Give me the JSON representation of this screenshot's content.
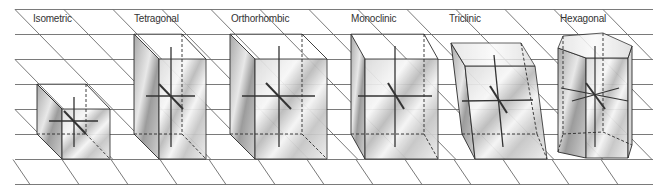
{
  "figure": {
    "type": "crystal-systems-diagram",
    "systems": [
      {
        "label": "Isometric",
        "label_x": 33,
        "label_y": 19
      },
      {
        "label": "Tetragonal",
        "label_x": 134,
        "label_y": 19
      },
      {
        "label": "Orthorhombic",
        "label_x": 231,
        "label_y": 19
      },
      {
        "label": "Monoclinic",
        "label_x": 351,
        "label_y": 19
      },
      {
        "label": "Triclinic",
        "label_x": 449,
        "label_y": 19
      },
      {
        "label": "Hexagonal",
        "label_x": 560,
        "label_y": 19
      }
    ],
    "colors": {
      "grid_line": "#6e6e6e",
      "edge": "#2a2a2a",
      "axis": "#333333",
      "face_light": "#f2f2f2",
      "face_mid": "#c8c8c8",
      "face_dark": "#9a9a9a"
    }
  }
}
